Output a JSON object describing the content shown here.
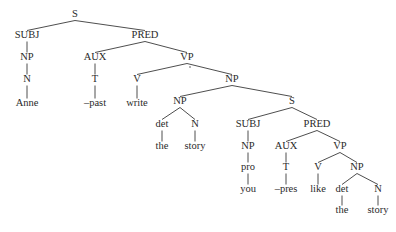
{
  "diagram": {
    "type": "syntax-tree",
    "sentence": "Anne -past write the story you -pres like the story",
    "nodes": [
      {
        "id": "n0",
        "label": "S",
        "x": 75,
        "y": 15,
        "kind": "cat"
      },
      {
        "id": "n1",
        "label": "SUBJ",
        "x": 27,
        "y": 36,
        "kind": "cat"
      },
      {
        "id": "n2",
        "label": "PRED",
        "x": 145,
        "y": 36,
        "kind": "cat"
      },
      {
        "id": "n3",
        "label": "NP",
        "x": 27,
        "y": 58,
        "kind": "cat"
      },
      {
        "id": "n4",
        "label": "AUX",
        "x": 95,
        "y": 58,
        "kind": "cat"
      },
      {
        "id": "n5",
        "label": "VP",
        "x": 187,
        "y": 58,
        "kind": "cat"
      },
      {
        "id": "n6",
        "label": "N",
        "x": 27,
        "y": 80,
        "kind": "cat"
      },
      {
        "id": "n7",
        "label": "T",
        "x": 95,
        "y": 80,
        "kind": "cat"
      },
      {
        "id": "n8",
        "label": "V",
        "x": 137,
        "y": 80,
        "kind": "cat"
      },
      {
        "id": "n9",
        "label": "NP",
        "x": 232,
        "y": 80,
        "kind": "cat"
      },
      {
        "id": "n10",
        "label": "Anne",
        "x": 27,
        "y": 104,
        "kind": "word"
      },
      {
        "id": "n11",
        "label": "–past",
        "x": 95,
        "y": 104,
        "kind": "word"
      },
      {
        "id": "n12",
        "label": "write",
        "x": 137,
        "y": 104,
        "kind": "word"
      },
      {
        "id": "n13",
        "label": "NP",
        "x": 180,
        "y": 102,
        "kind": "cat"
      },
      {
        "id": "n14",
        "label": "S",
        "x": 292,
        "y": 102,
        "kind": "cat"
      },
      {
        "id": "n15",
        "label": "det",
        "x": 162,
        "y": 125,
        "kind": "cat"
      },
      {
        "id": "n16",
        "label": "N",
        "x": 195,
        "y": 125,
        "kind": "cat"
      },
      {
        "id": "n17",
        "label": "SUBJ",
        "x": 248,
        "y": 125,
        "kind": "cat"
      },
      {
        "id": "n18",
        "label": "PRED",
        "x": 317,
        "y": 125,
        "kind": "cat"
      },
      {
        "id": "n19",
        "label": "the",
        "x": 162,
        "y": 147,
        "kind": "word"
      },
      {
        "id": "n20",
        "label": "story",
        "x": 195,
        "y": 147,
        "kind": "word"
      },
      {
        "id": "n21",
        "label": "NP",
        "x": 248,
        "y": 147,
        "kind": "cat"
      },
      {
        "id": "n22",
        "label": "AUX",
        "x": 286,
        "y": 147,
        "kind": "cat"
      },
      {
        "id": "n23",
        "label": "VP",
        "x": 340,
        "y": 147,
        "kind": "cat"
      },
      {
        "id": "n24",
        "label": "pro",
        "x": 248,
        "y": 168,
        "kind": "cat"
      },
      {
        "id": "n25",
        "label": "T",
        "x": 286,
        "y": 168,
        "kind": "cat"
      },
      {
        "id": "n26",
        "label": "V",
        "x": 318,
        "y": 168,
        "kind": "cat"
      },
      {
        "id": "n27",
        "label": "NP",
        "x": 357,
        "y": 168,
        "kind": "cat"
      },
      {
        "id": "n28",
        "label": "you",
        "x": 248,
        "y": 190,
        "kind": "word"
      },
      {
        "id": "n29",
        "label": "–pres",
        "x": 286,
        "y": 190,
        "kind": "word"
      },
      {
        "id": "n30",
        "label": "like",
        "x": 318,
        "y": 190,
        "kind": "word"
      },
      {
        "id": "n31",
        "label": "det",
        "x": 342,
        "y": 190,
        "kind": "cat"
      },
      {
        "id": "n32",
        "label": "N",
        "x": 378,
        "y": 190,
        "kind": "cat"
      },
      {
        "id": "n33",
        "label": "the",
        "x": 342,
        "y": 211,
        "kind": "word"
      },
      {
        "id": "n34",
        "label": "story",
        "x": 378,
        "y": 211,
        "kind": "word"
      }
    ],
    "edges": [
      [
        "n0",
        "n1"
      ],
      [
        "n0",
        "n2"
      ],
      [
        "n1",
        "n3"
      ],
      [
        "n2",
        "n4"
      ],
      [
        "n2",
        "n5"
      ],
      [
        "n3",
        "n6"
      ],
      [
        "n4",
        "n7"
      ],
      [
        "n5",
        "n8"
      ],
      [
        "n5",
        "n9"
      ],
      [
        "n6",
        "n10"
      ],
      [
        "n7",
        "n11"
      ],
      [
        "n8",
        "n12"
      ],
      [
        "n9",
        "n13"
      ],
      [
        "n9",
        "n14"
      ],
      [
        "n13",
        "n15"
      ],
      [
        "n13",
        "n16"
      ],
      [
        "n14",
        "n17"
      ],
      [
        "n14",
        "n18"
      ],
      [
        "n15",
        "n19"
      ],
      [
        "n16",
        "n20"
      ],
      [
        "n17",
        "n21"
      ],
      [
        "n18",
        "n22"
      ],
      [
        "n18",
        "n23"
      ],
      [
        "n21",
        "n24"
      ],
      [
        "n22",
        "n25"
      ],
      [
        "n23",
        "n26"
      ],
      [
        "n23",
        "n27"
      ],
      [
        "n24",
        "n28"
      ],
      [
        "n25",
        "n29"
      ],
      [
        "n26",
        "n30"
      ],
      [
        "n27",
        "n31"
      ],
      [
        "n27",
        "n32"
      ],
      [
        "n31",
        "n33"
      ],
      [
        "n32",
        "n34"
      ]
    ],
    "marks": [
      {
        "x": 190,
        "y": 67
      }
    ]
  }
}
